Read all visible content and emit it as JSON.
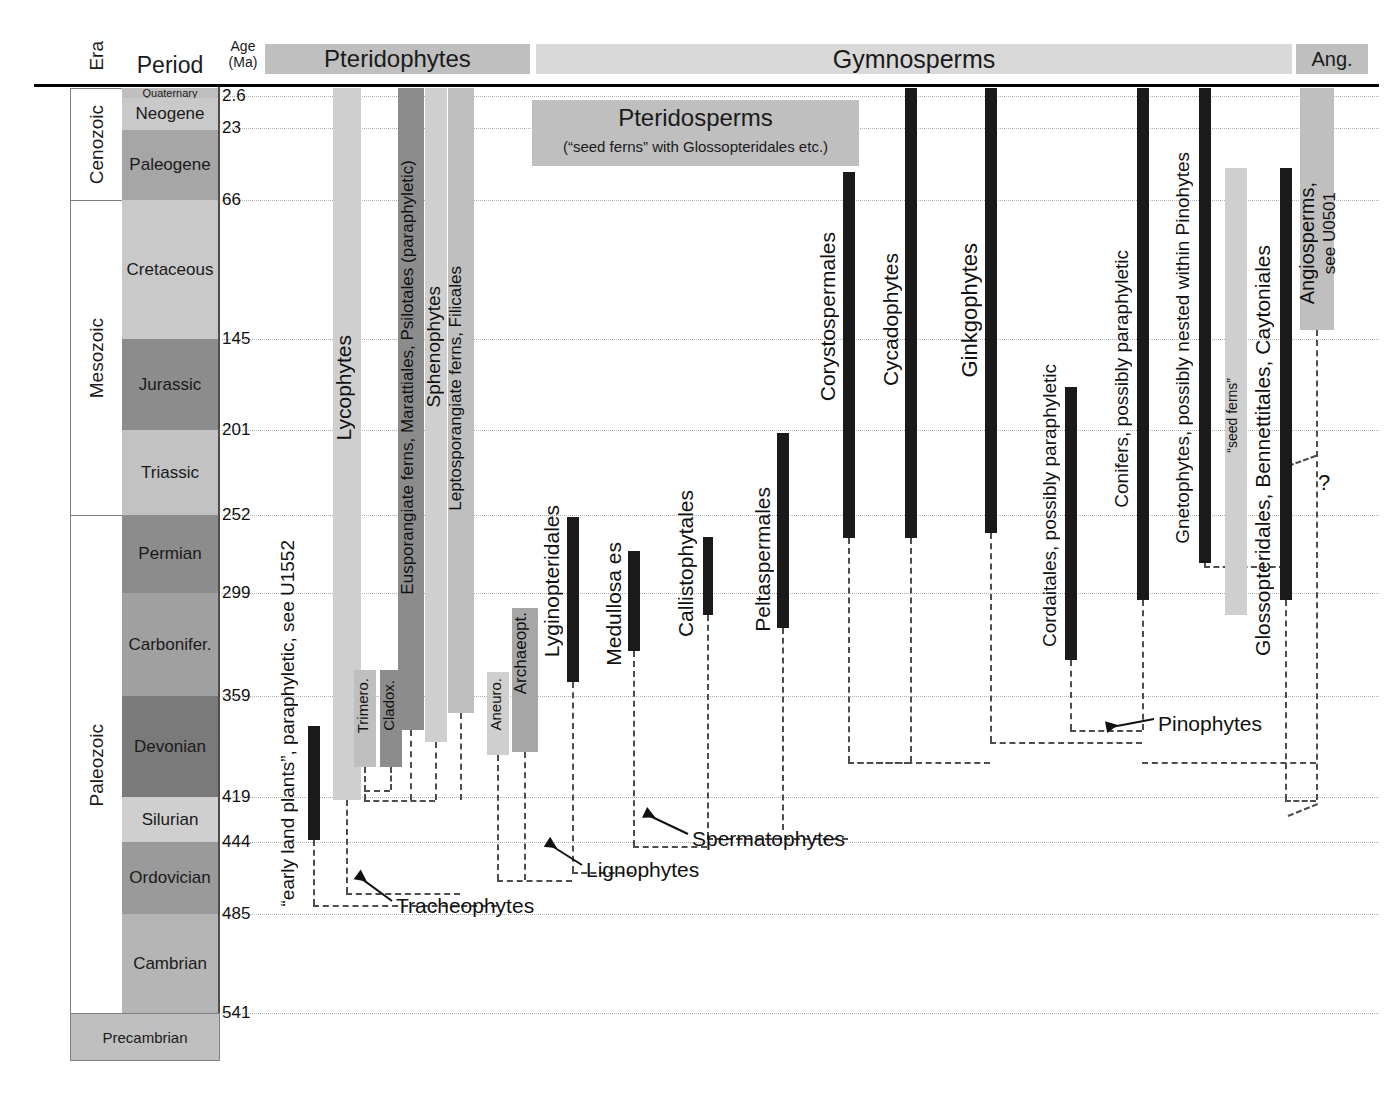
{
  "headers": {
    "era": "Era",
    "period": "Period",
    "age_line1": "Age",
    "age_line2": "(Ma)"
  },
  "top_bands": [
    {
      "name": "pteridophytes",
      "label": "Pteridophytes",
      "color": "#bfbfbf"
    },
    {
      "name": "gymnosperms",
      "label": "Gymnosperms",
      "color": "#d9d9d9"
    },
    {
      "name": "angiosperms-short",
      "label": "Ang.",
      "color": "#bfbfbf"
    }
  ],
  "pteridosperms_box": {
    "title": "Pteridosperms",
    "subtitle": "(“seed ferns” with Glossopteridales etc.)",
    "color": "#bfbfbf"
  },
  "eras": [
    {
      "label": "Cenozoic",
      "top": 88,
      "height": 112
    },
    {
      "label": "Mesozoic",
      "top": 200,
      "height": 315
    },
    {
      "label": "Paleozoic",
      "top": 515,
      "height": 498
    }
  ],
  "periods": [
    {
      "label": "Quaternary",
      "top": 88,
      "height": 10,
      "color": "#bfbfbf",
      "size": 11
    },
    {
      "label": "Neogene",
      "top": 98,
      "height": 32,
      "color": "#c9c9c9",
      "size": 17
    },
    {
      "label": "Paleogene",
      "top": 130,
      "height": 70,
      "color": "#a6a6a6",
      "size": 17
    },
    {
      "label": "Cretaceous",
      "top": 200,
      "height": 139,
      "color": "#c9c9c9",
      "size": 17
    },
    {
      "label": "Jurassic",
      "top": 339,
      "height": 91,
      "color": "#8c8c8c",
      "size": 17
    },
    {
      "label": "Triassic",
      "top": 430,
      "height": 85,
      "color": "#c2c2c2",
      "size": 17
    },
    {
      "label": "Permian",
      "top": 515,
      "height": 78,
      "color": "#8c8c8c",
      "size": 17
    },
    {
      "label": "Carbonifer.",
      "top": 593,
      "height": 103,
      "color": "#a0a0a0",
      "size": 17
    },
    {
      "label": "Devonian",
      "top": 696,
      "height": 101,
      "color": "#7a7a7a",
      "size": 17
    },
    {
      "label": "Silurian",
      "top": 797,
      "height": 45,
      "color": "#cfcfcf",
      "size": 17
    },
    {
      "label": "Ordovician",
      "top": 842,
      "height": 72,
      "color": "#9a9a9a",
      "size": 17
    },
    {
      "label": "Cambrian",
      "top": 914,
      "height": 99,
      "color": "#b5b5b5",
      "size": 17
    }
  ],
  "precambrian": {
    "label": "Precambrian",
    "color": "#bfbfbf"
  },
  "age_ticks": [
    {
      "value": "2.6",
      "y": 96
    },
    {
      "value": "23",
      "y": 128
    },
    {
      "value": "66",
      "y": 200
    },
    {
      "value": "145",
      "y": 339
    },
    {
      "value": "201",
      "y": 430
    },
    {
      "value": "252",
      "y": 515
    },
    {
      "value": "299",
      "y": 593
    },
    {
      "value": "359",
      "y": 696
    },
    {
      "value": "419",
      "y": 797
    },
    {
      "value": "444",
      "y": 842
    },
    {
      "value": "485",
      "y": 914
    },
    {
      "value": "541",
      "y": 1013
    }
  ],
  "chart_data": {
    "type": "range-bar",
    "xlabel": "Plant groups",
    "ylabel": "Age (Ma)",
    "ylim": [
      541,
      0
    ],
    "axis_direction": "inverted (oldest at bottom)",
    "grid": true,
    "bars": [
      {
        "name": "early-land-plants",
        "label": "“early land plants”, paraphyletic, see U1552",
        "x": 308,
        "w": 12,
        "top": 726,
        "bottom": 840,
        "color": "#1a1a1a",
        "label_x": 277,
        "label_y": 540,
        "label_h": 350,
        "label_size": 19
      },
      {
        "name": "lycophytes",
        "label": "Lycophytes",
        "x": 333,
        "w": 28,
        "top": 88,
        "bottom": 800,
        "color": "#cfcfcf",
        "label_x": 332,
        "label_y": 335,
        "label_h": 190,
        "label_size": 21
      },
      {
        "name": "trimerophytes",
        "label": "Trimero.",
        "x": 354,
        "w": 22,
        "top": 670,
        "bottom": 767,
        "color": "#bfbfbf",
        "label_x": 354,
        "label_y": 678,
        "label_h": 84,
        "label_size": 15
      },
      {
        "name": "cladoxylopsida",
        "label": "Cladox.",
        "x": 380,
        "w": 22,
        "top": 670,
        "bottom": 767,
        "color": "#8c8c8c",
        "label_x": 380,
        "label_y": 680,
        "label_h": 80,
        "label_size": 15
      },
      {
        "name": "eusporangiate-ferns",
        "label": "Eusporangiate ferns, Marattiales, Psilotales (paraphyletic)",
        "x": 398,
        "w": 26,
        "top": 88,
        "bottom": 730,
        "color": "#8c8c8c",
        "label_x": 398,
        "label_y": 160,
        "label_h": 575,
        "label_size": 17
      },
      {
        "name": "sphenophytes",
        "label": "Sphenophytes",
        "x": 425,
        "w": 22,
        "top": 88,
        "bottom": 742,
        "color": "#cfcfcf",
        "label_x": 423,
        "label_y": 286,
        "label_h": 240,
        "label_size": 19
      },
      {
        "name": "filicales",
        "label": "Leptosporangiate ferns, Filicales",
        "x": 448,
        "w": 26,
        "top": 88,
        "bottom": 713,
        "color": "#bfbfbf",
        "label_x": 446,
        "label_y": 266,
        "label_h": 345,
        "label_size": 17
      },
      {
        "name": "aneurophytales",
        "label": "Aneuro.",
        "x": 487,
        "w": 22,
        "top": 672,
        "bottom": 755,
        "color": "#cfcfcf",
        "label_x": 487,
        "label_y": 678,
        "label_h": 78,
        "label_size": 15
      },
      {
        "name": "archaeopteridales",
        "label": "Archaeopt.",
        "x": 512,
        "w": 26,
        "top": 608,
        "bottom": 752,
        "color": "#a6a6a6",
        "label_x": 511,
        "label_y": 612,
        "label_h": 122,
        "label_size": 17
      },
      {
        "name": "lyginopteridales",
        "label": "Lyginopteridales",
        "x": 567,
        "w": 12,
        "top": 517,
        "bottom": 682,
        "color": "#1a1a1a",
        "label_x": 540,
        "label_y": 505,
        "label_h": 185,
        "label_size": 21
      },
      {
        "name": "medullosales",
        "label": "Medullosa es",
        "x": 628,
        "w": 12,
        "top": 551,
        "bottom": 651,
        "color": "#1a1a1a",
        "label_x": 602,
        "label_y": 542,
        "label_h": 160,
        "label_size": 21
      },
      {
        "name": "callistophytales",
        "label": "Callistophytales",
        "x": 703,
        "w": 10,
        "top": 537,
        "bottom": 615,
        "color": "#1a1a1a",
        "label_x": 674,
        "label_y": 490,
        "label_h": 180,
        "label_size": 21
      },
      {
        "name": "peltaspermales",
        "label": "Peltaspermales",
        "x": 777,
        "w": 12,
        "top": 433,
        "bottom": 628,
        "color": "#1a1a1a",
        "label_x": 751,
        "label_y": 487,
        "label_h": 175,
        "label_size": 21
      },
      {
        "name": "corystospermales",
        "label": "Corystospermales",
        "x": 843,
        "w": 12,
        "top": 172,
        "bottom": 538,
        "color": "#1a1a1a",
        "label_x": 816,
        "label_y": 232,
        "label_h": 205,
        "label_size": 21
      },
      {
        "name": "cycadophytes",
        "label": "Cycadophytes",
        "x": 905,
        "w": 12,
        "top": 88,
        "bottom": 538,
        "color": "#1a1a1a",
        "label_x": 879,
        "label_y": 253,
        "label_h": 170,
        "label_size": 21
      },
      {
        "name": "ginkgophytes",
        "label": "Ginkgophytes",
        "x": 985,
        "w": 12,
        "top": 88,
        "bottom": 533,
        "color": "#1a1a1a",
        "label_x": 957,
        "label_y": 243,
        "label_h": 165,
        "label_size": 22
      },
      {
        "name": "cordaitales",
        "label": "Cordaitales, possibly paraphyletic",
        "x": 1065,
        "w": 12,
        "top": 387,
        "bottom": 660,
        "color": "#1a1a1a",
        "label_x": 1039,
        "label_y": 364,
        "label_h": 305,
        "label_size": 19
      },
      {
        "name": "conifers",
        "label": "Conifers, possibly paraphyletic",
        "x": 1137,
        "w": 12,
        "top": 88,
        "bottom": 600,
        "color": "#1a1a1a",
        "label_x": 1111,
        "label_y": 250,
        "label_h": 285,
        "label_size": 19
      },
      {
        "name": "gnetophytes",
        "label": "Gnetophytes, possibly nested within Pinohytes",
        "x": 1199,
        "w": 12,
        "top": 88,
        "bottom": 563,
        "color": "#1a1a1a",
        "label_x": 1172,
        "label_y": 152,
        "label_h": 420,
        "label_size": 19
      },
      {
        "name": "seed-ferns-band",
        "label": "“seed ferns”",
        "x": 1225,
        "w": 22,
        "top": 168,
        "bottom": 615,
        "color": "#cfcfcf",
        "label_x": 1224,
        "label_y": 378,
        "label_h": 120,
        "label_size": 14
      },
      {
        "name": "glossopteridales",
        "label": "Glossopteridales, Bennettitales, Caytoniales",
        "x": 1280,
        "w": 12,
        "top": 168,
        "bottom": 600,
        "color": "#1a1a1a",
        "label_x": 1251,
        "label_y": 245,
        "label_h": 390,
        "label_size": 21
      },
      {
        "name": "angiosperms",
        "label": "Angiosperms,",
        "x": 1300,
        "w": 34,
        "top": 88,
        "bottom": 330,
        "color": "#bfbfbf",
        "label_x": 1296,
        "label_y": 182,
        "label_h": 148,
        "label_size": 20
      },
      {
        "name": "angiosperms-ref",
        "label": "see U0501",
        "x": 0,
        "w": 0,
        "top": 0,
        "bottom": 0,
        "color": "#bfbfbf",
        "label_x": 1320,
        "label_y": 192,
        "label_h": 120,
        "label_size": 17
      }
    ],
    "annotations": [
      {
        "name": "tracheophytes",
        "label": "Tracheophytes",
        "x": 396,
        "y": 894
      },
      {
        "name": "lignophytes",
        "label": "Lignophytes",
        "x": 586,
        "y": 858
      },
      {
        "name": "spermatophytes",
        "label": "Spermatophytes",
        "x": 692,
        "y": 827
      },
      {
        "name": "pinophytes",
        "label": "Pinophytes",
        "x": 1158,
        "y": 712
      },
      {
        "name": "uncertainty",
        "label": "?",
        "x": 1318,
        "y": 470
      }
    ]
  }
}
